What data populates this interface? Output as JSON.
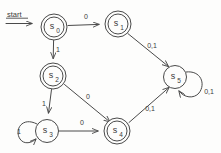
{
  "diagram": {
    "kind": "finite-state-machine",
    "start_label": "start",
    "states": [
      {
        "id": "s0",
        "label": "s",
        "sub": "0",
        "accepting": true,
        "cx": 54,
        "cy": 27
      },
      {
        "id": "s1",
        "label": "s",
        "sub": "1",
        "accepting": true,
        "cx": 118,
        "cy": 24
      },
      {
        "id": "s2",
        "label": "s",
        "sub": "2",
        "accepting": true,
        "cx": 53,
        "cy": 76
      },
      {
        "id": "s3",
        "label": "s",
        "sub": "3",
        "accepting": false,
        "cx": 47,
        "cy": 131
      },
      {
        "id": "s4",
        "label": "s",
        "sub": "4",
        "accepting": true,
        "cx": 117,
        "cy": 131
      },
      {
        "id": "s5",
        "label": "s",
        "sub": "5",
        "accepting": false,
        "cx": 175,
        "cy": 77
      }
    ],
    "transitions": [
      {
        "from": "s0",
        "to": "s1",
        "label": "0",
        "lx": 86,
        "ly": 17
      },
      {
        "from": "s0",
        "to": "s2",
        "label": "1",
        "lx": 58,
        "ly": 50
      },
      {
        "from": "s1",
        "to": "s5",
        "label": "0,1",
        "lx": 152,
        "ly": 46
      },
      {
        "from": "s2",
        "to": "s3",
        "label": "1",
        "lx": 44,
        "ly": 104
      },
      {
        "from": "s2",
        "to": "s4",
        "label": "0",
        "lx": 88,
        "ly": 97
      },
      {
        "from": "s3",
        "to": "s3",
        "label": "1",
        "lx": 19,
        "ly": 132,
        "self": true
      },
      {
        "from": "s3",
        "to": "s4",
        "label": "0",
        "lx": 82,
        "ly": 123
      },
      {
        "from": "s4",
        "to": "s5",
        "label": "0,1",
        "lx": 150,
        "ly": 109
      },
      {
        "from": "s5",
        "to": "s5",
        "label": "0,1",
        "lx": 209,
        "ly": 92,
        "self": true
      }
    ],
    "colors": {
      "stroke": "#4a4a4a",
      "text": "#3a3a3a",
      "background": "#fdfdfc"
    },
    "radius_outer": 13,
    "radius_inner": 10
  }
}
